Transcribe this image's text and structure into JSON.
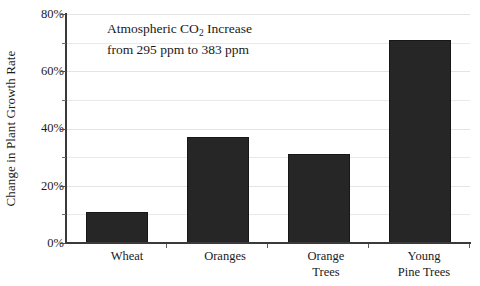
{
  "chart_data": {
    "type": "bar",
    "title": "",
    "categories": [
      "Wheat",
      "Oranges",
      "Orange\nTrees",
      "Young\nPine Trees"
    ],
    "values": [
      11,
      37,
      31,
      71
    ],
    "value_unit": "%",
    "xlabel": "",
    "ylabel": "Change in Plant Growth Rate",
    "ylim": [
      0,
      80
    ],
    "ytick_step": 20,
    "ytick_labels": [
      "0%",
      "20%",
      "40%",
      "60%",
      "80%"
    ],
    "minor_gridline_step": 10,
    "grid": true,
    "legend": "none",
    "bar_color": "#262626",
    "bar_border_color": "#171717",
    "gridline_color": "#e9e9e9",
    "axis_color": "#3a3a3a",
    "annotations": [
      {
        "line1_prefix": "Atmospheric CO",
        "line1_sub": "2",
        "line1_suffix": " Increase",
        "line2": "from 295 ppm to 383 ppm"
      }
    ]
  }
}
